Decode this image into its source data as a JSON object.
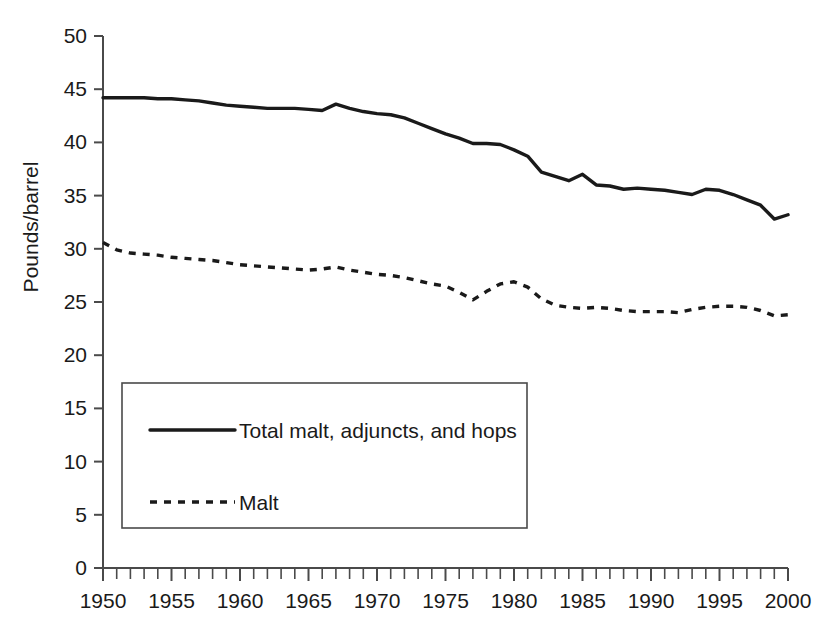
{
  "chart_data": {
    "type": "line",
    "title": "",
    "xlabel": "",
    "ylabel": "Pounds/barrel",
    "xlim": [
      1950,
      2000
    ],
    "ylim": [
      0,
      50
    ],
    "ytick_step": 5,
    "xtick_step": 5,
    "xminor_step": 1,
    "grid": false,
    "legend_position": "inside-lower-left",
    "y_ticks": [
      "0",
      "5",
      "10",
      "15",
      "20",
      "25",
      "30",
      "35",
      "40",
      "45",
      "50"
    ],
    "x_ticks": [
      "1950",
      "1955",
      "1960",
      "1965",
      "1970",
      "1975",
      "1980",
      "1985",
      "1990",
      "1995",
      "2000"
    ],
    "x": [
      1950,
      1951,
      1952,
      1953,
      1954,
      1955,
      1956,
      1957,
      1958,
      1959,
      1960,
      1961,
      1962,
      1963,
      1964,
      1965,
      1966,
      1967,
      1968,
      1969,
      1970,
      1971,
      1972,
      1973,
      1974,
      1975,
      1976,
      1977,
      1978,
      1979,
      1980,
      1981,
      1982,
      1983,
      1984,
      1985,
      1986,
      1987,
      1988,
      1989,
      1990,
      1991,
      1992,
      1993,
      1994,
      1995,
      1996,
      1997,
      1998,
      1999,
      2000
    ],
    "series": [
      {
        "name": "Total malt, adjuncts, and hops",
        "style": "solid",
        "color": "#1a1a1a",
        "values": [
          44.2,
          44.2,
          44.2,
          44.2,
          44.1,
          44.1,
          44.0,
          43.9,
          43.7,
          43.5,
          43.4,
          43.3,
          43.2,
          43.2,
          43.2,
          43.1,
          43.0,
          43.6,
          43.2,
          42.9,
          42.7,
          42.6,
          42.3,
          41.8,
          41.3,
          40.8,
          40.4,
          39.9,
          39.9,
          39.8,
          39.3,
          38.7,
          37.2,
          36.8,
          36.4,
          37.0,
          36.0,
          35.9,
          35.6,
          35.7,
          35.6,
          35.5,
          35.3,
          35.1,
          35.6,
          35.5,
          35.1,
          34.6,
          34.1,
          32.8,
          33.2
        ]
      },
      {
        "name": "Malt",
        "style": "dashed",
        "color": "#1a1a1a",
        "values": [
          30.6,
          29.9,
          29.6,
          29.5,
          29.4,
          29.2,
          29.1,
          29.0,
          28.9,
          28.7,
          28.5,
          28.4,
          28.3,
          28.2,
          28.1,
          28.0,
          28.1,
          28.3,
          28.0,
          27.8,
          27.6,
          27.5,
          27.3,
          27.0,
          26.7,
          26.5,
          25.9,
          25.2,
          26.0,
          26.7,
          26.9,
          26.4,
          25.3,
          24.7,
          24.5,
          24.4,
          24.5,
          24.4,
          24.2,
          24.1,
          24.1,
          24.1,
          24.0,
          24.3,
          24.5,
          24.6,
          24.6,
          24.5,
          24.2,
          23.7,
          23.8
        ]
      }
    ]
  },
  "legend": {
    "entries": [
      {
        "label": "Total malt, adjuncts, and hops",
        "style": "solid"
      },
      {
        "label": "Malt",
        "style": "dashed"
      }
    ]
  },
  "axes": {
    "y_title": "Pounds/barrel"
  }
}
